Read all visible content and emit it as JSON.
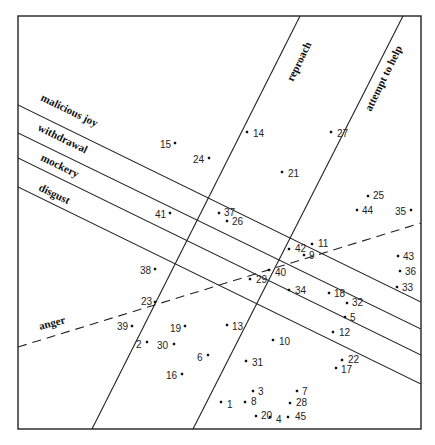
{
  "diagram": {
    "type": "vector-projection-scatter",
    "frame": {
      "x1": 18,
      "y1": 16,
      "x2": 421,
      "y2": 429
    },
    "axes": [
      {
        "id": "malicious-joy",
        "label": "malicious joy",
        "style": "solid",
        "x1": 18,
        "y1": 105,
        "x2": 421,
        "y2": 302,
        "label_x": 40,
        "label_y": 100,
        "angle": 26
      },
      {
        "id": "withdrawal",
        "label": "withdrawal",
        "style": "solid",
        "x1": 18,
        "y1": 133,
        "x2": 421,
        "y2": 329,
        "label_x": 37,
        "label_y": 130,
        "angle": 26
      },
      {
        "id": "mockery",
        "label": "mockery",
        "style": "solid",
        "x1": 18,
        "y1": 158,
        "x2": 421,
        "y2": 355,
        "label_x": 40,
        "label_y": 160,
        "angle": 26
      },
      {
        "id": "disgust",
        "label": "disgust",
        "style": "solid",
        "x1": 18,
        "y1": 187,
        "x2": 421,
        "y2": 384,
        "label_x": 38,
        "label_y": 190,
        "angle": 26
      },
      {
        "id": "reproach",
        "label": "reproach",
        "style": "solid",
        "x1": 300,
        "y1": 16,
        "x2": 92,
        "y2": 429,
        "label_x": 293,
        "label_y": 82,
        "angle": -64
      },
      {
        "id": "attempt-to-help",
        "label": "attempt to help",
        "style": "solid",
        "x1": 403,
        "y1": 16,
        "x2": 193,
        "y2": 429,
        "label_x": 371,
        "label_y": 112,
        "angle": -64
      },
      {
        "id": "anger",
        "label": "anger",
        "style": "dashed",
        "x1": 18,
        "y1": 347,
        "x2": 421,
        "y2": 223,
        "label_x": 40,
        "label_y": 330,
        "angle": -15
      }
    ],
    "points": [
      {
        "id": "1",
        "x": 221,
        "y": 402,
        "lx": 227,
        "ly": 405
      },
      {
        "id": "2",
        "x": 147,
        "y": 342,
        "lx": 136,
        "ly": 345
      },
      {
        "id": "3",
        "x": 253,
        "y": 391,
        "lx": 258,
        "ly": 392
      },
      {
        "id": "4",
        "x": 270,
        "y": 417,
        "lx": 276,
        "ly": 420
      },
      {
        "id": "5",
        "x": 345,
        "y": 317,
        "lx": 350,
        "ly": 318
      },
      {
        "id": "6",
        "x": 208,
        "y": 355,
        "lx": 197,
        "ly": 358
      },
      {
        "id": "7",
        "x": 297,
        "y": 391,
        "lx": 302,
        "ly": 392
      },
      {
        "id": "8",
        "x": 245,
        "y": 402,
        "lx": 251,
        "ly": 402
      },
      {
        "id": "9",
        "x": 304,
        "y": 255,
        "lx": 309,
        "ly": 256
      },
      {
        "id": "10",
        "x": 273,
        "y": 340,
        "lx": 279,
        "ly": 342
      },
      {
        "id": "11",
        "x": 312,
        "y": 244,
        "lx": 318,
        "ly": 244
      },
      {
        "id": "12",
        "x": 333,
        "y": 332,
        "lx": 339,
        "ly": 333
      },
      {
        "id": "13",
        "x": 227,
        "y": 325,
        "lx": 232,
        "ly": 327
      },
      {
        "id": "14",
        "x": 247,
        "y": 132,
        "lx": 253,
        "ly": 134
      },
      {
        "id": "15",
        "x": 175,
        "y": 143,
        "lx": 160,
        "ly": 145
      },
      {
        "id": "16",
        "x": 182,
        "y": 374,
        "lx": 166,
        "ly": 376
      },
      {
        "id": "17",
        "x": 336,
        "y": 368,
        "lx": 341,
        "ly": 370
      },
      {
        "id": "18",
        "x": 329,
        "y": 293,
        "lx": 334,
        "ly": 294
      },
      {
        "id": "19",
        "x": 185,
        "y": 326,
        "lx": 170,
        "ly": 329
      },
      {
        "id": "20",
        "x": 256,
        "y": 416,
        "lx": 261,
        "ly": 416
      },
      {
        "id": "21",
        "x": 282,
        "y": 172,
        "lx": 288,
        "ly": 174
      },
      {
        "id": "22",
        "x": 342,
        "y": 360,
        "lx": 348,
        "ly": 360
      },
      {
        "id": "23",
        "x": 155,
        "y": 302,
        "lx": 141,
        "ly": 302
      },
      {
        "id": "24",
        "x": 209,
        "y": 158,
        "lx": 193,
        "ly": 160
      },
      {
        "id": "25",
        "x": 368,
        "y": 196,
        "lx": 373,
        "ly": 196
      },
      {
        "id": "26",
        "x": 227,
        "y": 221,
        "lx": 232,
        "ly": 222
      },
      {
        "id": "27",
        "x": 331,
        "y": 132,
        "lx": 337,
        "ly": 134
      },
      {
        "id": "28",
        "x": 290,
        "y": 403,
        "lx": 296,
        "ly": 403
      },
      {
        "id": "29",
        "x": 250,
        "y": 279,
        "lx": 256,
        "ly": 280
      },
      {
        "id": "30",
        "x": 174,
        "y": 344,
        "lx": 157,
        "ly": 346
      },
      {
        "id": "31",
        "x": 246,
        "y": 361,
        "lx": 252,
        "ly": 363
      },
      {
        "id": "32",
        "x": 347,
        "y": 303,
        "lx": 352,
        "ly": 303
      },
      {
        "id": "33",
        "x": 397,
        "y": 287,
        "lx": 402,
        "ly": 288
      },
      {
        "id": "34",
        "x": 289,
        "y": 290,
        "lx": 295,
        "ly": 291
      },
      {
        "id": "35",
        "x": 411,
        "y": 210,
        "lx": 395,
        "ly": 212
      },
      {
        "id": "36",
        "x": 400,
        "y": 271,
        "lx": 405,
        "ly": 272
      },
      {
        "id": "37",
        "x": 219,
        "y": 213,
        "lx": 224,
        "ly": 213
      },
      {
        "id": "38",
        "x": 155,
        "y": 269,
        "lx": 140,
        "ly": 271
      },
      {
        "id": "39",
        "x": 132,
        "y": 326,
        "lx": 117,
        "ly": 327
      },
      {
        "id": "40",
        "x": 269,
        "y": 270,
        "lx": 275,
        "ly": 273
      },
      {
        "id": "41",
        "x": 170,
        "y": 213,
        "lx": 155,
        "ly": 215
      },
      {
        "id": "42",
        "x": 289,
        "y": 249,
        "lx": 295,
        "ly": 249
      },
      {
        "id": "43",
        "x": 398,
        "y": 256,
        "lx": 403,
        "ly": 257
      },
      {
        "id": "44",
        "x": 357,
        "y": 210,
        "lx": 362,
        "ly": 211
      },
      {
        "id": "45",
        "x": 288,
        "y": 417,
        "lx": 295,
        "ly": 417
      }
    ]
  }
}
